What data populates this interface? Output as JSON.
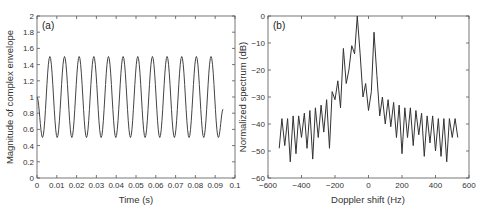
{
  "chart_data": [
    {
      "type": "line",
      "panel_label": "(a)",
      "title": "",
      "xlabel": "Time (s)",
      "ylabel": "Magnitude of complex envelope",
      "xlim": [
        0,
        0.1
      ],
      "ylim": [
        0,
        2
      ],
      "xticks": [
        "0",
        "0.01",
        "0.02",
        "0.03",
        "0.04",
        "0.05",
        "0.06",
        "0.07",
        "0.08",
        "0.09",
        "0.1"
      ],
      "yticks": [
        "0",
        "0.2",
        "0.4",
        "0.6",
        "0.8",
        "1",
        "1.2",
        "1.4",
        "1.6",
        "1.8",
        "2"
      ],
      "grid": false,
      "series": [
        {
          "name": "envelope",
          "description": "periodic oscillation between ~0.5 and ~1.5, period ~0.0074 s, from t=0 to t~0.094 s",
          "x": [
            0,
            0.0028,
            0.0065,
            0.0102,
            0.0139,
            0.0176,
            0.0213,
            0.025,
            0.0287,
            0.0324,
            0.0361,
            0.0398,
            0.0435,
            0.0472,
            0.0509,
            0.0546,
            0.0583,
            0.062,
            0.0657,
            0.0694,
            0.0731,
            0.0768,
            0.0805,
            0.0842,
            0.0879,
            0.0916,
            0.094
          ],
          "values": [
            1.0,
            0.5,
            1.5,
            0.5,
            1.5,
            0.5,
            1.5,
            0.5,
            1.5,
            0.5,
            1.5,
            0.5,
            1.5,
            0.5,
            1.5,
            0.5,
            1.5,
            0.5,
            1.5,
            0.5,
            1.5,
            0.5,
            1.5,
            0.5,
            1.5,
            0.5,
            0.85
          ]
        }
      ]
    },
    {
      "type": "line",
      "panel_label": "(b)",
      "title": "",
      "xlabel": "Doppler shift (Hz)",
      "ylabel": "Normalized spectrum (dB)",
      "xlim": [
        -600,
        600
      ],
      "ylim": [
        -60,
        0
      ],
      "xticks": [
        "-600",
        "-400",
        "-200",
        "0",
        "200",
        "400",
        "600"
      ],
      "yticks": [
        "-60",
        "-50",
        "-40",
        "-30",
        "-20",
        "-10",
        "0"
      ],
      "grid": false,
      "series": [
        {
          "name": "spectrum",
          "description": "two main peaks at about -67 Hz (0 dB) and +67 Hz (-6 dB), sidelobes every ~33 Hz decaying to ~-38 dB at edges, nulls to ~-50..-54 dB",
          "x": [
            -533,
            -517,
            -500,
            -483,
            -467,
            -450,
            -433,
            -417,
            -400,
            -383,
            -367,
            -350,
            -333,
            -317,
            -300,
            -283,
            -267,
            -250,
            -233,
            -217,
            -200,
            -183,
            -167,
            -150,
            -133,
            -117,
            -100,
            -83,
            -67,
            -50,
            -33,
            -17,
            0,
            17,
            33,
            50,
            67,
            83,
            100,
            117,
            133,
            150,
            167,
            183,
            200,
            217,
            233,
            250,
            267,
            283,
            300,
            317,
            333,
            350,
            367,
            383,
            400,
            417,
            433,
            450,
            467,
            483,
            500,
            517,
            533
          ],
          "values": [
            -49,
            -38,
            -48,
            -38,
            -54,
            -37,
            -51,
            -37,
            -45,
            -36,
            -49,
            -35,
            -53,
            -34,
            -45,
            -33,
            -43,
            -31,
            -49,
            -28,
            -31,
            -24,
            -34,
            -12,
            -25,
            -20,
            -11,
            -14,
            0,
            -14,
            -30,
            -25,
            -35,
            -28,
            -6,
            -22,
            -37,
            -30,
            -40,
            -31,
            -41,
            -32,
            -45,
            -33,
            -51,
            -34,
            -45,
            -34,
            -48,
            -35,
            -44,
            -36,
            -52,
            -37,
            -47,
            -37,
            -50,
            -38,
            -52,
            -38,
            -54,
            -38,
            -45,
            -38,
            -45
          ]
        }
      ]
    }
  ]
}
